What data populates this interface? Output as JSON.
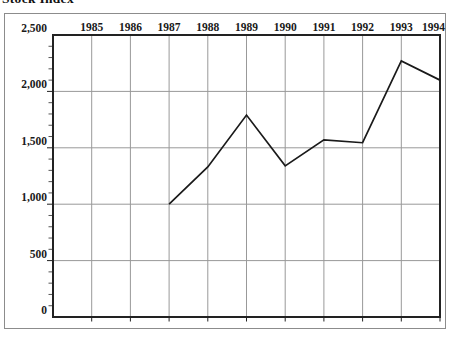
{
  "chart_data": {
    "type": "line",
    "title": "Stock Index",
    "x_labels": [
      "1985",
      "1986",
      "1987",
      "1988",
      "1989",
      "1990",
      "1991",
      "1992",
      "1993",
      "1994"
    ],
    "x_start_year": 1985,
    "y_tick_labels": [
      "0",
      "500",
      "1,000",
      "1,500",
      "2,000",
      "2,500"
    ],
    "y_tick_values": [
      0,
      500,
      1000,
      1500,
      2000,
      2500
    ],
    "ylim": [
      0,
      2500
    ],
    "minor_tick_step": 100,
    "grid": "on",
    "legend": "none",
    "series": [
      {
        "name": "index-line",
        "x": [
          1987,
          1988,
          1989,
          1990,
          1991,
          1992,
          1993,
          1994
        ],
        "values": [
          1000,
          1330,
          1790,
          1340,
          1570,
          1545,
          2270,
          2100
        ]
      }
    ]
  },
  "colors": {
    "line": "#1a1a1a",
    "grid": "#999999",
    "axis": "#222222",
    "minor_tick": "#555555",
    "frame": "#8c8c8c",
    "text": "#1a1a1a",
    "background": "#ffffff"
  }
}
